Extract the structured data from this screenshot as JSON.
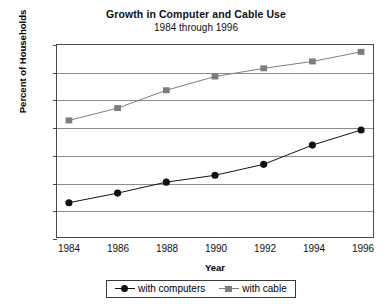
{
  "chart_data": {
    "type": "line",
    "title": "Growth in Computer and Cable Use",
    "subtitle": "1984 through 1996",
    "xlabel": "Year",
    "ylabel": "Percent of Households",
    "x": [
      1984,
      1986,
      1988,
      1990,
      1992,
      1994,
      1996
    ],
    "xtick_labels": [
      "1984",
      "1986",
      "1988",
      "1990",
      "1992",
      "1994",
      "1996"
    ],
    "ytick_labels": [
      "0",
      "10",
      "20",
      "30",
      "40",
      "50",
      "60",
      "70"
    ],
    "yticks": [
      0,
      10,
      20,
      30,
      40,
      50,
      60,
      70
    ],
    "xlim": [
      1984,
      1996
    ],
    "ylim": [
      0,
      70
    ],
    "grid": "horizontal",
    "legend_position": "bottom",
    "series": [
      {
        "name": "with computers",
        "marker": "circle",
        "color": "#111111",
        "values": [
          12.5,
          16,
          20,
          22.5,
          26.5,
          33.5,
          39
        ]
      },
      {
        "name": "with cable",
        "marker": "square",
        "color": "#7d7d7d",
        "values": [
          42.5,
          47,
          53.5,
          58.5,
          61.5,
          64,
          67.5
        ]
      }
    ]
  },
  "legend": {
    "items": [
      {
        "label": "with computers"
      },
      {
        "label": "with cable"
      }
    ]
  },
  "colors": {
    "computers": "#111111",
    "cable": "#7d7d7d",
    "grid": "#8d8d8d",
    "frame": "#4a4a4a"
  }
}
